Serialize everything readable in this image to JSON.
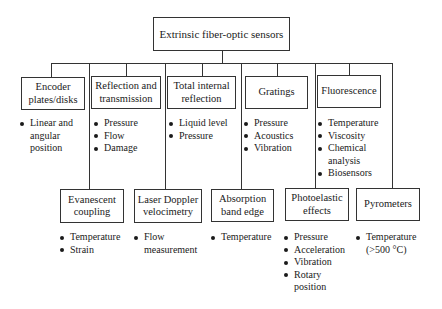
{
  "root": {
    "label": "Extrinsic fiber-optic sensors"
  },
  "top_row": [
    {
      "label": "Encoder plates/disks",
      "items": [
        "Linear and\nangular\nposition"
      ]
    },
    {
      "label": "Reflection and transmission",
      "items": [
        "Pressure",
        "Flow",
        "Damage"
      ]
    },
    {
      "label": "Total internal reflection",
      "items": [
        "Liquid level",
        "Pressure"
      ]
    },
    {
      "label": "Gratings",
      "items": [
        "Pressure",
        "Acoustics",
        "Vibration"
      ]
    },
    {
      "label": "Fluorescence",
      "items": [
        "Temperature",
        "Viscosity",
        "Chemical\nanalysis",
        "Biosensors"
      ]
    }
  ],
  "bottom_row": [
    {
      "label": "Evanescent coupling",
      "items": [
        "Temperature",
        "Strain"
      ]
    },
    {
      "label": "Laser Doppler velocimetry",
      "items": [
        "Flow\nmeasurement"
      ]
    },
    {
      "label": "Absorption band edge",
      "items": [
        "Temperature"
      ]
    },
    {
      "label": "Photoelastic effects",
      "items": [
        "Pressure",
        "Acceleration",
        "Vibration",
        "Rotary\nposition"
      ]
    },
    {
      "label": "Pyrometers",
      "items": [
        "Temperature\n(>500 °C)"
      ]
    }
  ]
}
